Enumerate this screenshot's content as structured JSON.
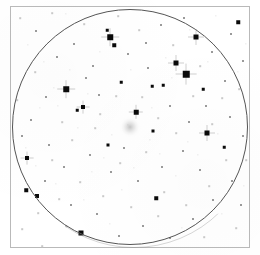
{
  "chart": {
    "kind": "astronomical-finder-chart",
    "background_color": "#ffffff",
    "frame": {
      "border_color": "#b9b9b9",
      "x": 10,
      "y": 6,
      "width": 240,
      "height": 242
    },
    "field_of_view_circle": {
      "label": "field-of-view boundary",
      "border_color": "#555555",
      "center_x": 130,
      "center_y": 127,
      "radius": 118
    },
    "arc_artifact": {
      "label": "secondary faint arc",
      "border_color": "rgba(120,120,120,0.30)",
      "center_x": 134,
      "center_y": 126,
      "radius": 122
    },
    "target_object": {
      "label": "diffuse target object",
      "type": "nebulous",
      "center_x": 130,
      "center_y": 127,
      "size": 22,
      "color": "#969696"
    }
  },
  "chart_data": {
    "type": "scatter",
    "xlabel": "",
    "ylabel": "",
    "xlim": [
      0,
      260
    ],
    "ylim": [
      0,
      255
    ],
    "grid": false,
    "legend": "none",
    "series": [
      {
        "name": "stars",
        "point_color": "#0a0a0a",
        "points": [
          {
            "x": 110,
            "y": 37,
            "size": 5.5,
            "mag_class": 2,
            "spikes": true
          },
          {
            "x": 114,
            "y": 45,
            "size": 3.5,
            "mag_class": 3,
            "spikes": false
          },
          {
            "x": 196,
            "y": 37,
            "size": 5.0,
            "mag_class": 2,
            "spikes": true
          },
          {
            "x": 176,
            "y": 63,
            "size": 5.0,
            "mag_class": 2,
            "spikes": true
          },
          {
            "x": 186,
            "y": 74,
            "size": 6.5,
            "mag_class": 1,
            "spikes": true
          },
          {
            "x": 66,
            "y": 89,
            "size": 5.5,
            "mag_class": 2,
            "spikes": true
          },
          {
            "x": 83,
            "y": 107,
            "size": 4.0,
            "mag_class": 3,
            "spikes": true
          },
          {
            "x": 136,
            "y": 112,
            "size": 4.5,
            "mag_class": 3,
            "spikes": true
          },
          {
            "x": 207,
            "y": 133,
            "size": 5.0,
            "mag_class": 2,
            "spikes": true
          },
          {
            "x": 27,
            "y": 158,
            "size": 4.0,
            "mag_class": 3,
            "spikes": true
          },
          {
            "x": 26,
            "y": 190,
            "size": 3.5,
            "mag_class": 3,
            "spikes": false
          },
          {
            "x": 37,
            "y": 196,
            "size": 4.0,
            "mag_class": 3,
            "spikes": false
          },
          {
            "x": 81,
            "y": 233,
            "size": 5.0,
            "mag_class": 2,
            "spikes": false
          },
          {
            "x": 156,
            "y": 198,
            "size": 3.5,
            "mag_class": 3,
            "spikes": false
          },
          {
            "x": 153,
            "y": 131,
            "size": 3.0,
            "mag_class": 4,
            "spikes": false
          },
          {
            "x": 108,
            "y": 145,
            "size": 3.0,
            "mag_class": 4,
            "spikes": false
          },
          {
            "x": 238,
            "y": 22,
            "size": 3.5,
            "mag_class": 3,
            "spikes": false
          },
          {
            "x": 107,
            "y": 30,
            "size": 2.5,
            "mag_class": 4,
            "spikes": false
          },
          {
            "x": 224,
            "y": 147,
            "size": 2.5,
            "mag_class": 4,
            "spikes": false
          },
          {
            "x": 152,
            "y": 86,
            "size": 2.5,
            "mag_class": 4,
            "spikes": false
          },
          {
            "x": 121,
            "y": 82,
            "size": 2.5,
            "mag_class": 4,
            "spikes": false
          },
          {
            "x": 163,
            "y": 85,
            "size": 2.5,
            "mag_class": 4,
            "spikes": false
          },
          {
            "x": 77,
            "y": 110,
            "size": 2.5,
            "mag_class": 4,
            "spikes": false
          },
          {
            "x": 203,
            "y": 89,
            "size": 2.5,
            "mag_class": 4,
            "spikes": false
          }
        ]
      },
      {
        "name": "faint-stars",
        "point_color": "#9a9a9a",
        "points": [
          {
            "x": 36,
            "y": 31,
            "size": 2.0
          },
          {
            "x": 57,
            "y": 57,
            "size": 2.0
          },
          {
            "x": 74,
            "y": 44,
            "size": 2.0
          },
          {
            "x": 93,
            "y": 66,
            "size": 2.0
          },
          {
            "x": 128,
            "y": 54,
            "size": 2.0
          },
          {
            "x": 146,
            "y": 43,
            "size": 2.0
          },
          {
            "x": 161,
            "y": 25,
            "size": 2.0
          },
          {
            "x": 184,
            "y": 18,
            "size": 2.0
          },
          {
            "x": 212,
            "y": 52,
            "size": 2.0
          },
          {
            "x": 231,
            "y": 34,
            "size": 2.0
          },
          {
            "x": 243,
            "y": 61,
            "size": 2.0
          },
          {
            "x": 225,
            "y": 81,
            "size": 2.0
          },
          {
            "x": 206,
            "y": 106,
            "size": 2.0
          },
          {
            "x": 230,
            "y": 117,
            "size": 2.0
          },
          {
            "x": 243,
            "y": 136,
            "size": 2.0
          },
          {
            "x": 189,
            "y": 122,
            "size": 2.0
          },
          {
            "x": 170,
            "y": 106,
            "size": 2.0
          },
          {
            "x": 148,
            "y": 68,
            "size": 2.0
          },
          {
            "x": 99,
            "y": 95,
            "size": 2.0
          },
          {
            "x": 86,
            "y": 78,
            "size": 2.0
          },
          {
            "x": 46,
            "y": 97,
            "size": 2.0
          },
          {
            "x": 31,
            "y": 120,
            "size": 2.0
          },
          {
            "x": 22,
            "y": 136,
            "size": 2.0
          },
          {
            "x": 49,
            "y": 145,
            "size": 2.0
          },
          {
            "x": 64,
            "y": 167,
            "size": 2.0
          },
          {
            "x": 45,
            "y": 181,
            "size": 2.0
          },
          {
            "x": 71,
            "y": 205,
            "size": 2.0
          },
          {
            "x": 97,
            "y": 214,
            "size": 2.0
          },
          {
            "x": 119,
            "y": 236,
            "size": 2.0
          },
          {
            "x": 143,
            "y": 226,
            "size": 2.0
          },
          {
            "x": 170,
            "y": 238,
            "size": 2.0
          },
          {
            "x": 193,
            "y": 219,
            "size": 2.0
          },
          {
            "x": 213,
            "y": 200,
            "size": 2.0
          },
          {
            "x": 232,
            "y": 181,
            "size": 2.0
          },
          {
            "x": 241,
            "y": 205,
            "size": 2.0
          },
          {
            "x": 162,
            "y": 167,
            "size": 2.0
          },
          {
            "x": 138,
            "y": 181,
            "size": 2.0
          },
          {
            "x": 111,
            "y": 172,
            "size": 2.0
          },
          {
            "x": 90,
            "y": 155,
            "size": 2.0
          },
          {
            "x": 124,
            "y": 148,
            "size": 2.0
          },
          {
            "x": 183,
            "y": 151,
            "size": 2.0
          },
          {
            "x": 200,
            "y": 170,
            "size": 2.0
          }
        ]
      },
      {
        "name": "very-faint-stars",
        "point_color": "#c9c9c9",
        "points": [
          {
            "x": 20,
            "y": 18,
            "size": 1.6
          },
          {
            "x": 52,
            "y": 13,
            "size": 1.6
          },
          {
            "x": 84,
            "y": 24,
            "size": 1.6
          },
          {
            "x": 118,
            "y": 16,
            "size": 1.6
          },
          {
            "x": 139,
            "y": 30,
            "size": 1.6
          },
          {
            "x": 173,
            "y": 45,
            "size": 1.6
          },
          {
            "x": 200,
            "y": 66,
            "size": 1.6
          },
          {
            "x": 222,
            "y": 98,
            "size": 1.6
          },
          {
            "x": 239,
            "y": 89,
            "size": 1.6
          },
          {
            "x": 246,
            "y": 160,
            "size": 1.6
          },
          {
            "x": 226,
            "y": 160,
            "size": 1.6
          },
          {
            "x": 209,
            "y": 186,
            "size": 1.6
          },
          {
            "x": 186,
            "y": 205,
            "size": 1.6
          },
          {
            "x": 158,
            "y": 216,
            "size": 1.6
          },
          {
            "x": 131,
            "y": 207,
            "size": 1.6
          },
          {
            "x": 103,
            "y": 196,
            "size": 1.6
          },
          {
            "x": 80,
            "y": 182,
            "size": 1.6
          },
          {
            "x": 59,
            "y": 199,
            "size": 1.6
          },
          {
            "x": 38,
            "y": 213,
            "size": 1.6
          },
          {
            "x": 22,
            "y": 229,
            "size": 1.6
          },
          {
            "x": 17,
            "y": 100,
            "size": 1.6
          },
          {
            "x": 35,
            "y": 72,
            "size": 1.6
          },
          {
            "x": 62,
            "y": 122,
            "size": 1.6
          },
          {
            "x": 95,
            "y": 128,
            "size": 1.6
          },
          {
            "x": 116,
            "y": 96,
            "size": 1.6
          },
          {
            "x": 142,
            "y": 97,
            "size": 1.6
          },
          {
            "x": 158,
            "y": 118,
            "size": 1.6
          },
          {
            "x": 176,
            "y": 133,
            "size": 1.6
          },
          {
            "x": 146,
            "y": 152,
            "size": 1.6
          },
          {
            "x": 120,
            "y": 163,
            "size": 1.6
          },
          {
            "x": 100,
            "y": 114,
            "size": 1.6
          },
          {
            "x": 72,
            "y": 140,
            "size": 1.6
          },
          {
            "x": 52,
            "y": 160,
            "size": 1.6
          },
          {
            "x": 193,
            "y": 96,
            "size": 1.6
          },
          {
            "x": 212,
            "y": 124,
            "size": 1.6
          },
          {
            "x": 164,
            "y": 192,
            "size": 1.6
          },
          {
            "x": 236,
            "y": 228,
            "size": 1.6
          },
          {
            "x": 204,
            "y": 237,
            "size": 1.6
          },
          {
            "x": 66,
            "y": 226,
            "size": 1.6
          },
          {
            "x": 42,
            "y": 246,
            "size": 1.6
          }
        ]
      },
      {
        "name": "background-stars",
        "point_color": "#dedede",
        "points": [
          {
            "x": 28,
            "y": 45,
            "size": 1.3
          },
          {
            "x": 44,
            "y": 62,
            "size": 1.3
          },
          {
            "x": 66,
            "y": 14,
            "size": 1.3
          },
          {
            "x": 100,
            "y": 52,
            "size": 1.3
          },
          {
            "x": 131,
            "y": 70,
            "size": 1.3
          },
          {
            "x": 166,
            "y": 58,
            "size": 1.3
          },
          {
            "x": 190,
            "y": 30,
            "size": 1.3
          },
          {
            "x": 216,
            "y": 16,
            "size": 1.3
          },
          {
            "x": 246,
            "y": 44,
            "size": 1.3
          },
          {
            "x": 238,
            "y": 72,
            "size": 1.3
          },
          {
            "x": 218,
            "y": 134,
            "size": 1.3
          },
          {
            "x": 198,
            "y": 155,
            "size": 1.3
          },
          {
            "x": 176,
            "y": 176,
            "size": 1.3
          },
          {
            "x": 150,
            "y": 140,
            "size": 1.3
          },
          {
            "x": 128,
            "y": 125,
            "size": 1.3
          },
          {
            "x": 112,
            "y": 135,
            "size": 1.3
          },
          {
            "x": 88,
            "y": 94,
            "size": 1.3
          },
          {
            "x": 70,
            "y": 70,
            "size": 1.3
          },
          {
            "x": 54,
            "y": 88,
            "size": 1.3
          },
          {
            "x": 40,
            "y": 108,
            "size": 1.3
          },
          {
            "x": 26,
            "y": 148,
            "size": 1.3
          },
          {
            "x": 36,
            "y": 166,
            "size": 1.3
          },
          {
            "x": 56,
            "y": 184,
            "size": 1.3
          },
          {
            "x": 84,
            "y": 200,
            "size": 1.3
          },
          {
            "x": 110,
            "y": 224,
            "size": 1.3
          },
          {
            "x": 140,
            "y": 244,
            "size": 1.3
          },
          {
            "x": 182,
            "y": 228,
            "size": 1.3
          },
          {
            "x": 222,
            "y": 214,
            "size": 1.3
          },
          {
            "x": 244,
            "y": 186,
            "size": 1.3
          },
          {
            "x": 160,
            "y": 154,
            "size": 1.3
          },
          {
            "x": 134,
            "y": 168,
            "size": 1.3
          },
          {
            "x": 104,
            "y": 158,
            "size": 1.3
          },
          {
            "x": 78,
            "y": 128,
            "size": 1.3
          },
          {
            "x": 58,
            "y": 106,
            "size": 1.3
          },
          {
            "x": 92,
            "y": 172,
            "size": 1.3
          },
          {
            "x": 172,
            "y": 78,
            "size": 1.3
          },
          {
            "x": 152,
            "y": 108,
            "size": 1.3
          },
          {
            "x": 208,
            "y": 62,
            "size": 1.3
          },
          {
            "x": 122,
            "y": 190,
            "size": 1.3
          },
          {
            "x": 188,
            "y": 142,
            "size": 1.3
          }
        ]
      }
    ]
  }
}
